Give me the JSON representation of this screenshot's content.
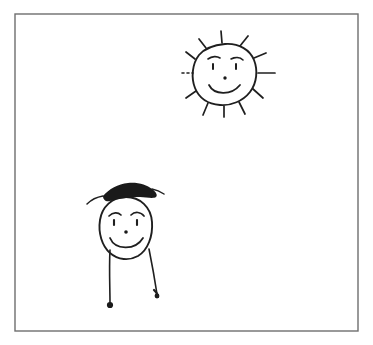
{
  "artwork": {
    "title": "Child's crayon-style drawing",
    "medium": "pen line drawing on white paper",
    "background_color": "#ffffff",
    "ink_color": "#1f1f1f",
    "hair_color": "#1a1a1a",
    "frame_color": "#6e6e6e",
    "canvas": {
      "width": 373,
      "height": 345
    }
  },
  "frame": {
    "label": "paper border rectangle",
    "x": 15,
    "y": 14,
    "width": 343,
    "height": 317,
    "stroke_width": 1.4
  },
  "subjects": [
    {
      "id": "sun",
      "label": "smiling sun",
      "center_x": 225,
      "center_y": 75,
      "body_radius": 31,
      "ray_count": 11,
      "has_face": true,
      "features": [
        "eyebrows",
        "eyes",
        "nose",
        "smile",
        "rays"
      ]
    },
    {
      "id": "person",
      "label": "stick figure person with hair",
      "head_center_x": 126,
      "head_center_y": 228,
      "head_radius_x": 27,
      "head_radius_y": 31,
      "leg_count": 2,
      "has_face": true,
      "features": [
        "hair-scribble",
        "eyebrows",
        "eyes",
        "nose",
        "smile",
        "legs",
        "feet"
      ]
    }
  ],
  "sun": {
    "body_path": "M 225 44 C 239 43 250 50 254 60 C 258 70 257 83 250 92 C 243 101 231 106 220 105 C 208 104 199 98 195 88 C 191 78 192 64 199 55 C 205 48 214 45 225 44 Z",
    "rays": [
      {
        "name": "ray-north",
        "x1": 222,
        "y1": 43,
        "x2": 221,
        "y2": 31
      },
      {
        "name": "ray-north-east",
        "x1": 240,
        "y1": 46,
        "x2": 248,
        "y2": 36
      },
      {
        "name": "ray-east-upper",
        "x1": 254,
        "y1": 58,
        "x2": 266,
        "y2": 53
      },
      {
        "name": "ray-east",
        "x1": 258,
        "y1": 73,
        "x2": 275,
        "y2": 73
      },
      {
        "name": "ray-east-lower",
        "x1": 253,
        "y1": 89,
        "x2": 263,
        "y2": 98
      },
      {
        "name": "ray-south-east",
        "x1": 239,
        "y1": 102,
        "x2": 245,
        "y2": 114
      },
      {
        "name": "ray-south",
        "x1": 224,
        "y1": 106,
        "x2": 224,
        "y2": 117
      },
      {
        "name": "ray-south-west",
        "x1": 208,
        "y1": 103,
        "x2": 203,
        "y2": 115
      },
      {
        "name": "ray-west-lower",
        "x1": 196,
        "y1": 91,
        "x2": 186,
        "y2": 98
      },
      {
        "name": "ray-west-upper",
        "x1": 195,
        "y1": 59,
        "x2": 186,
        "y2": 52
      },
      {
        "name": "ray-north-west",
        "x1": 206,
        "y1": 48,
        "x2": 199,
        "y2": 39
      }
    ],
    "dotted_ray": {
      "name": "ray-west-dotted",
      "x1": 182,
      "y1": 73,
      "x2": 193,
      "y2": 73
    },
    "eyebrow_left": "M 208 59 C 212 56 217 56 220 58",
    "eyebrow_right": "M 231 59 C 235 57 240 57 243 60",
    "eye_left": {
      "x1": 213,
      "y1": 64,
      "x2": 213,
      "y2": 69
    },
    "eye_right": {
      "x1": 236,
      "y1": 64,
      "x2": 236,
      "y2": 69
    },
    "nose": {
      "cx": 225,
      "cy": 78,
      "r": 1.7
    },
    "smile": "M 209 85 C 214 95 231 96 240 85"
  },
  "person": {
    "head_path": "M 126 197 C 140 197 151 207 152 222 C 153 236 148 250 138 256 C 129 261 118 260 110 253 C 102 246 98 233 100 220 C 102 207 112 197 126 197 Z",
    "hair_path": "M 103 196 C 109 189 118 184 128 183 C 138 182 147 185 152 189 C 156 192 158 195 156 197 C 153 199 146 197 140 197 C 130 197 118 199 110 201 C 106 202 103 200 103 196 Z",
    "hair_strand_left": "M 103 196 C 97 197 91 200 87 204",
    "hair_strand_right": "M 152 189 C 157 190 161 192 164 194",
    "eyebrow_left": "M 109 216 C 113 212 118 212 121 215",
    "eyebrow_right": "M 131 215 C 135 211 141 212 144 216",
    "eye_left": {
      "x1": 114,
      "y1": 220,
      "x2": 114,
      "y2": 225
    },
    "eye_right": {
      "x1": 137,
      "y1": 220,
      "x2": 137,
      "y2": 225
    },
    "nose": {
      "cx": 126,
      "cy": 232,
      "r": 1.8
    },
    "smile": "M 110 238 C 115 250 135 251 143 238",
    "leg_left": "M 110 250 C 109 268 110 288 110 303",
    "leg_right": "M 149 249 C 152 264 155 281 157 294",
    "foot_left": {
      "cx": 110,
      "cy": 305,
      "r": 3.1
    },
    "foot_right": {
      "cx": 157,
      "cy": 296,
      "r": 2.4
    },
    "foot_right_hook": "M 154 290 C 156 292 158 294 158 297"
  }
}
